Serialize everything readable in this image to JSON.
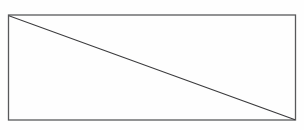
{
  "figure": {
    "name": "rectangle-with-diagonal",
    "caption": "",
    "background_color": "#fefefe",
    "canvas": {
      "width": 304,
      "height": 130
    },
    "shapes": {
      "rectangle": {
        "label": "rectangle-outline",
        "x": 8.5,
        "y": 15.0,
        "width": 287.0,
        "height": 105.0,
        "stroke_color": "#58595b",
        "stroke_width": 1.3,
        "fill": "none"
      },
      "diagonal": {
        "label": "diagonal-line",
        "x1": 9.5,
        "y1": 16.0,
        "x2": 294.5,
        "y2": 119.5,
        "stroke_color": "#3a3a3c",
        "stroke_width": 1.2
      }
    },
    "corners": {
      "top_left": "(9, 16)",
      "top_right": "(295, 15)",
      "bottom_left": "(9, 120)",
      "bottom_right": "(295, 120)"
    }
  }
}
